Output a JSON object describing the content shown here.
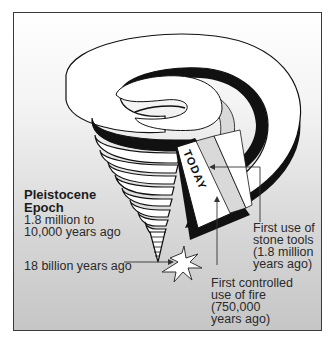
{
  "diagram": {
    "type": "spiral-timeline",
    "today_label": "TODAY",
    "labels": {
      "pleistocene_title": "Pleistocene\nEpoch",
      "pleistocene_range": "1.8 million to\n10,000 years ago",
      "big_bang": "18 billion years ago",
      "stone_tools": "First use of\nstone tools\n(1.8 million\nyears ago)",
      "fire": "First controlled\nuse of fire\n(750,000\nyears ago)"
    },
    "icons": [
      "starburst-icon",
      "arrow-icon"
    ],
    "colors": {
      "stroke": "#111111",
      "ribbon_top": "#ffffff",
      "ribbon_shadow": "#111111",
      "inner_band": "#d9d9d9",
      "text": "#2a2a2a"
    }
  }
}
